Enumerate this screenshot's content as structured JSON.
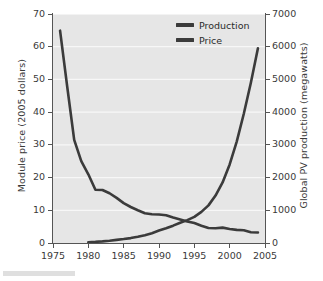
{
  "chart_data": {
    "type": "line",
    "title": "",
    "xlabel": "",
    "ylabel": "Module price (2005 dollars)",
    "ylabel_right": "Global PV production (megawatts)",
    "xlim": [
      1975,
      2005
    ],
    "ylim": [
      0,
      70
    ],
    "ylim_right": [
      0,
      7000
    ],
    "grid": "horizontal-white",
    "legend_position": "top-right-inside",
    "xticks": [
      1975,
      1980,
      1985,
      1990,
      1995,
      2000,
      2005
    ],
    "xtick_labels": [
      "1975",
      "1980",
      "1985",
      "1990",
      "1995",
      "2000",
      "2005"
    ],
    "yticks_left": [
      0,
      10,
      20,
      30,
      40,
      50,
      60,
      70
    ],
    "ytick_labels_left": [
      "0",
      "10",
      "20",
      "30",
      "40",
      "50",
      "60",
      "70"
    ],
    "yticks_right": [
      0,
      1000,
      2000,
      3000,
      4000,
      5000,
      6000,
      7000
    ],
    "ytick_labels_right": [
      "0",
      "1000",
      "2000",
      "3000",
      "4000",
      "5000",
      "6000",
      "7000"
    ],
    "series": [
      {
        "name": "Price",
        "axis": "left",
        "units": "2005 dollars per watt",
        "color": "#3b3b3b",
        "x": [
          1976,
          1977,
          1978,
          1979,
          1980,
          1981,
          1982,
          1983,
          1984,
          1985,
          1986,
          1987,
          1988,
          1989,
          1990,
          1991,
          1992,
          1993,
          1994,
          1995,
          1996,
          1997,
          1998,
          1999,
          2000,
          2001,
          2002,
          2003,
          2004
        ],
        "values": [
          64.9,
          48.0,
          31.5,
          25.0,
          21.0,
          16.3,
          16.2,
          15.2,
          13.8,
          12.2,
          11.0,
          10.0,
          9.1,
          8.8,
          8.7,
          8.5,
          7.8,
          7.2,
          6.6,
          6.1,
          5.3,
          4.6,
          4.5,
          4.7,
          4.3,
          4.0,
          3.9,
          3.3,
          3.2
        ]
      },
      {
        "name": "Production",
        "axis": "right",
        "units": "megawatts",
        "color": "#3b3b3b",
        "x": [
          1980,
          1981,
          1982,
          1983,
          1984,
          1985,
          1986,
          1987,
          1988,
          1989,
          1990,
          1991,
          1992,
          1993,
          1994,
          1995,
          1996,
          1997,
          1998,
          1999,
          2000,
          2001,
          2002,
          2003,
          2004
        ],
        "values": [
          25,
          35,
          50,
          70,
          95,
          120,
          150,
          190,
          240,
          300,
          380,
          450,
          530,
          620,
          700,
          800,
          950,
          1150,
          1450,
          1850,
          2400,
          3100,
          3950,
          4900,
          5950
        ]
      }
    ],
    "legend_entries": [
      "Production",
      "Price"
    ],
    "annotations": []
  },
  "legend": {
    "items": [
      {
        "label": "Production",
        "color": "#3b3b3b"
      },
      {
        "label": "Price",
        "color": "#3b3b3b"
      }
    ]
  },
  "axes": {
    "left_title": "Module price (2005 dollars)",
    "right_title": "Global PV production (megawatts)"
  }
}
